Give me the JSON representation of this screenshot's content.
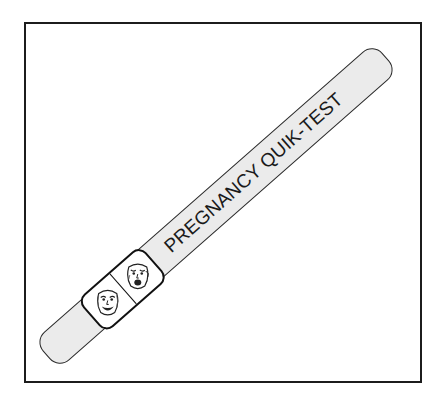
{
  "diagram": {
    "type": "illustration",
    "strip": {
      "label": "PREGNANCY QUIK-TEST",
      "fill_color": "#ebebeb",
      "outline_color": "#2a2a2a"
    },
    "result_window": {
      "cells": [
        {
          "icon": "happy-face-icon",
          "mood": "happy"
        },
        {
          "icon": "sad-face-icon",
          "mood": "sad"
        }
      ]
    },
    "frame": {
      "border_color": "#1c1c1c",
      "background": "#ffffff"
    }
  }
}
